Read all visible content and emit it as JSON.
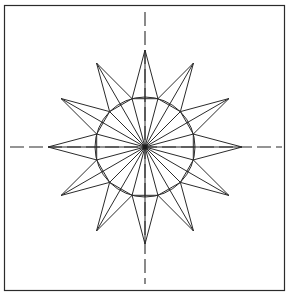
{
  "figure": {
    "canvas": {
      "width": 289,
      "height": 298,
      "background": "#ffffff"
    },
    "frame": {
      "label": "drawing border",
      "x": 4.5,
      "y": 5.5,
      "width": 280,
      "height": 285,
      "stroke": "#2b2b2b",
      "stroke_width": 1.2,
      "fill": "none"
    },
    "center": {
      "label": "center point",
      "x": 145,
      "y": 147,
      "dot_radius": 2.2
    },
    "geometry": {
      "points": 12,
      "angle_step_degrees": 30,
      "start_angle_degrees": -90,
      "outer_radius": 97,
      "inner_radius": 50,
      "star_schlafli": "{12/5}"
    },
    "circle": {
      "label": "inscribed circle",
      "cx": 145,
      "cy": 147,
      "r": 50,
      "stroke": "#2b2b2b",
      "stroke_width": 1,
      "fill": "none"
    },
    "star": {
      "label": "twelve point star outline",
      "stroke": "#2b2b2b",
      "stroke_width": 1,
      "fill": "none"
    },
    "spokes": {
      "label": "radial spokes",
      "count": 12,
      "stroke": "#2b2b2b",
      "stroke_width": 1
    },
    "chords": {
      "label": "inner dodecagon chords",
      "stroke": "#2b2b2b",
      "stroke_width": 1
    },
    "centerlines": {
      "label": "dash dot center axes",
      "stroke": "#2b2b2b",
      "stroke_width": 1.1,
      "dash_pattern": "14 5",
      "vertical": {
        "x": 145,
        "y1": 12,
        "y2": 284
      },
      "horizontal": {
        "y": 147,
        "x1": 10,
        "x2": 282
      }
    }
  }
}
